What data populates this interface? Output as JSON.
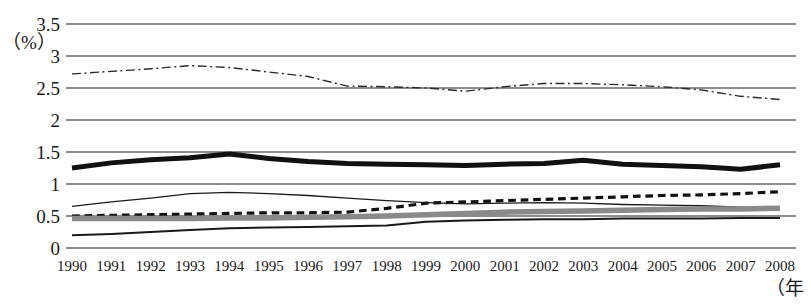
{
  "chart_data": {
    "type": "line",
    "title": "",
    "xlabel": "（年",
    "ylabel": "（%）",
    "ylim": [
      0,
      3.5
    ],
    "ytick_labels": [
      "0",
      "0.5",
      "1",
      "1.5",
      "2",
      "2.5",
      "3",
      "3.5"
    ],
    "ytick_values": [
      0,
      0.5,
      1,
      1.5,
      2,
      2.5,
      3,
      3.5
    ],
    "grid": true,
    "legend": "none",
    "categories": [
      "1990",
      "1991",
      "1992",
      "1993",
      "1994",
      "1995",
      "1996",
      "1997",
      "1998",
      "1999",
      "2000",
      "2001",
      "2002",
      "2003",
      "2004",
      "2005",
      "2006",
      "2007",
      "2008"
    ],
    "series": [
      {
        "name": "dash-dot-series",
        "style": "dash-dot",
        "color": "#2b2b2b",
        "width": 1.4,
        "values": [
          2.72,
          2.76,
          2.8,
          2.85,
          2.82,
          2.75,
          2.68,
          2.53,
          2.52,
          2.5,
          2.45,
          2.52,
          2.57,
          2.57,
          2.55,
          2.52,
          2.47,
          2.37,
          2.32
        ]
      },
      {
        "name": "thick-solid-series",
        "style": "solid",
        "color": "#111111",
        "width": 5.0,
        "values": [
          1.25,
          1.33,
          1.38,
          1.41,
          1.47,
          1.4,
          1.35,
          1.32,
          1.31,
          1.3,
          1.29,
          1.31,
          1.32,
          1.37,
          1.31,
          1.29,
          1.27,
          1.23,
          1.3
        ]
      },
      {
        "name": "dashed-series",
        "style": "dashed",
        "color": "#111111",
        "width": 3.2,
        "values": [
          0.5,
          0.51,
          0.52,
          0.53,
          0.54,
          0.55,
          0.55,
          0.56,
          0.62,
          0.7,
          0.72,
          0.74,
          0.76,
          0.78,
          0.8,
          0.82,
          0.83,
          0.85,
          0.88
        ]
      },
      {
        "name": "thin-solid-upper-series",
        "style": "solid",
        "color": "#1a1a1a",
        "width": 1.3,
        "values": [
          0.65,
          0.72,
          0.78,
          0.85,
          0.87,
          0.85,
          0.82,
          0.78,
          0.74,
          0.71,
          0.69,
          0.7,
          0.71,
          0.7,
          0.68,
          0.67,
          0.66,
          0.64,
          0.62
        ]
      },
      {
        "name": "gray-thick-series",
        "style": "solid",
        "color": "#8a8a8a",
        "width": 5.5,
        "values": [
          0.46,
          0.46,
          0.46,
          0.46,
          0.47,
          0.47,
          0.48,
          0.49,
          0.5,
          0.52,
          0.54,
          0.56,
          0.57,
          0.58,
          0.59,
          0.6,
          0.61,
          0.61,
          0.62
        ]
      },
      {
        "name": "thin-solid-lower-series",
        "style": "solid",
        "color": "#1a1a1a",
        "width": 2.0,
        "values": [
          0.2,
          0.22,
          0.25,
          0.28,
          0.31,
          0.32,
          0.33,
          0.34,
          0.35,
          0.41,
          0.43,
          0.44,
          0.45,
          0.45,
          0.46,
          0.46,
          0.46,
          0.47,
          0.47
        ]
      }
    ]
  },
  "axes": {
    "x_unit": "（年",
    "y_unit": "（%）"
  }
}
